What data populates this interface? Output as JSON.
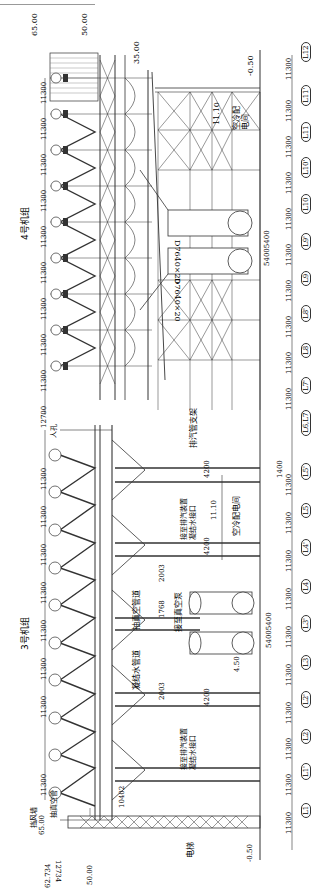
{
  "drawing": {
    "title_unit4": "4号机组",
    "title_unit3": "3号机组",
    "elevations": {
      "top_65_left": "65.00",
      "top_50": "50.00",
      "top_35": "35.00",
      "top_minus050": "-0.50",
      "bottom_65": "65.00",
      "bottom_62734": "62.734",
      "bottom_50": "50.00",
      "bottom_minus050": "-0.50",
      "level_1110_top": "11.10",
      "level_1110_mid": "11.10",
      "level_450": "4.50"
    },
    "labels": {
      "switch_room_top": "空冷配电间",
      "switch_room_mid": "空冷配电间",
      "exhaust_support": "排汽管支架",
      "manhole": "人孔",
      "vacuum_pipe": "抽真空管道",
      "to_vacuum": "接至真空泵",
      "condensate_pipe": "凝结水管道",
      "to_drain_1": "接至排汽装置凝结水接口",
      "to_drain_2": "接至排汽装置凝结水接口",
      "vacuum_left": "抽真空管",
      "wind_wall": "挡风墙",
      "elevator": "电梯",
      "pipe_dim_1": "D7640×20",
      "pipe_dim_2": "D7640×20"
    },
    "dims": {
      "upper_row": [
        "11300",
        "11300",
        "11300",
        "11300",
        "11300",
        "11300",
        "11300",
        "11300",
        "11300",
        "12700"
      ],
      "lower_row": [
        "11300",
        "11300",
        "11300",
        "11300",
        "11300",
        "11300",
        "11300",
        "11300"
      ],
      "d4200_a": "4200",
      "d4200_b": "4200",
      "d4200_c": "4200",
      "d2003_a": "2003",
      "d2003_b": "2003",
      "d1768": "1768",
      "d10402": "10402",
      "d12734": "12734",
      "d5400_top": "5400",
      "d5400_top2": "5400",
      "d5400_bot": "5400",
      "d5400_bot2": "5400",
      "d1400": "1400"
    },
    "axis_grid": {
      "labels": [
        "L12",
        "L11'",
        "L11",
        "L10'",
        "L10",
        "L9'",
        "L9",
        "L8'",
        "L8",
        "L7'",
        "L6,L7",
        "L5'",
        "L5",
        "L4'",
        "L4",
        "L3'",
        "L3",
        "L2'",
        "L2",
        "L1'",
        "L1"
      ],
      "spacings": [
        "11300",
        "11300",
        "11300",
        "11300",
        "11300",
        "11300",
        "11300",
        "11300",
        "11300",
        "11300",
        "1400",
        "11300",
        "11300",
        "11300",
        "11300",
        "11300",
        "11300",
        "11300",
        "11300",
        "11300",
        "11300"
      ]
    }
  }
}
